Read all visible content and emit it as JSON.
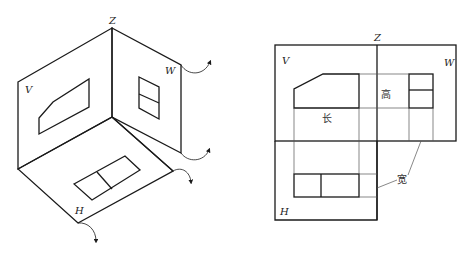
{
  "left_diagram": {
    "title": "three-projection-planes-isometric",
    "labels": {
      "z": "Z",
      "v": "V",
      "w": "W",
      "h": "H"
    }
  },
  "right_diagram": {
    "title": "unfolded-three-view-projection",
    "labels": {
      "z": "Z",
      "v": "V",
      "w": "W",
      "h": "H"
    },
    "dimensions": {
      "length": "长",
      "height": "高",
      "width": "宽"
    }
  },
  "colors": {
    "line": "#1a1a1a",
    "thin_line": "#555555",
    "background": "#ffffff"
  }
}
